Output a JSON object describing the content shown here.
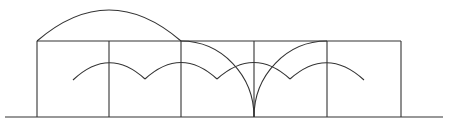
{
  "diagram": {
    "type": "arch-geometry",
    "stroke_color": "#333333",
    "background": "#ffffff",
    "baseline": {
      "x1": 5,
      "x2": 443,
      "y": 117
    },
    "box_top_y": 41,
    "verticals_x": [
      37,
      109,
      181,
      254,
      327,
      401
    ],
    "big_arc": {
      "from": [
        37,
        41
      ],
      "to": [
        181,
        41
      ],
      "peak_y": 10
    },
    "small_arcs": [
      {
        "from": [
          73,
          80
        ],
        "peak": [
          109,
          63
        ],
        "to": [
          145,
          79
        ]
      },
      {
        "from": [
          145,
          79
        ],
        "peak": [
          181,
          63
        ],
        "to": [
          217,
          79
        ]
      },
      {
        "from": [
          217,
          79
        ],
        "peak": [
          254,
          63
        ],
        "to": [
          290,
          79
        ]
      },
      {
        "from": [
          290,
          79
        ],
        "peak": [
          327,
          63
        ],
        "to": [
          364,
          80
        ]
      }
    ],
    "quarter_arcs": [
      {
        "from": [
          181,
          41
        ],
        "to": [
          254,
          117
        ]
      },
      {
        "from": [
          254,
          117
        ],
        "to": [
          327,
          41
        ]
      }
    ]
  }
}
